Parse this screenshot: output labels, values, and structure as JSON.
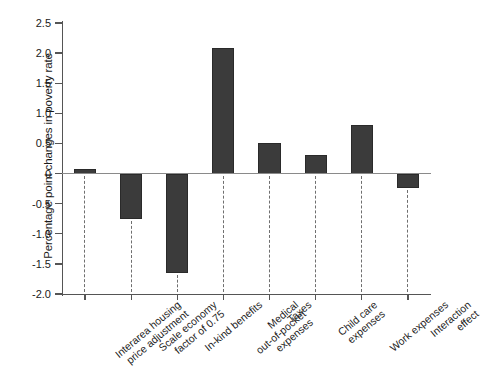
{
  "chart_data": {
    "type": "bar",
    "title": "",
    "subtitle": "",
    "xlabel": "",
    "ylabel": "Percentage point changes in poverty rate",
    "ylim": [
      -2.0,
      2.5
    ],
    "ytick_labels": [
      "2.5",
      "2.0",
      "1.5",
      "1.0",
      "0.5",
      "0",
      "-0.5",
      "-1.0",
      "-1.5",
      "-2.0"
    ],
    "ytick_values": [
      2.5,
      2.0,
      1.5,
      1.0,
      0.5,
      0,
      -0.5,
      -1.0,
      -1.5,
      -2.0
    ],
    "grid": false,
    "legend": "none",
    "bar_color": "#3b3b3b",
    "zero_line_color": "#8a8a8a",
    "axis_color": "#555555",
    "categories": [
      "Interarea housing\nprice adjustment",
      "Scale economy\nfactor of 0.75",
      "In-kind benefits",
      "Medical\nout-of-pocket\nexpenses",
      "Taxes",
      "Child care\nexpenses",
      "Work expenses",
      "Interaction effect"
    ],
    "values": [
      0.08,
      -0.75,
      -1.65,
      2.09,
      0.51,
      0.3,
      0.81,
      -0.24
    ]
  }
}
